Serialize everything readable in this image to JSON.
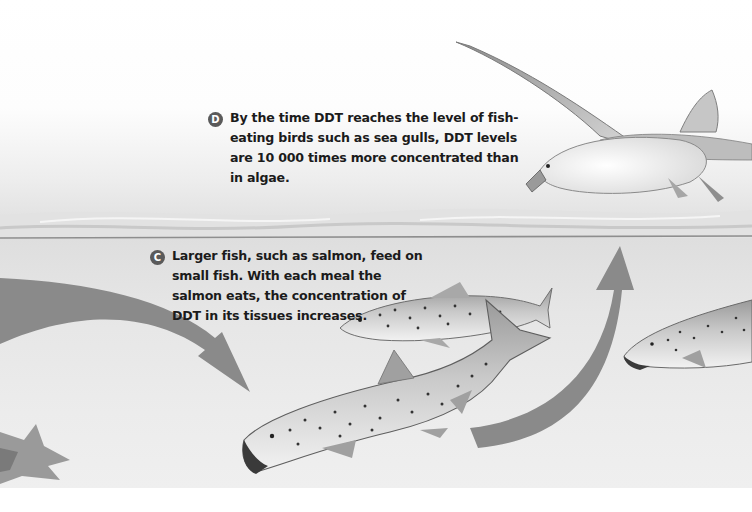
{
  "figure": {
    "callouts": [
      {
        "id": "D",
        "label": "D",
        "lines": [
          "By the time DDT reaches the level of fish-",
          "eating birds such as sea gulls, DDT levels",
          "are 10 000 times more concentrated than",
          "in algae."
        ]
      },
      {
        "id": "C",
        "label": "C",
        "lines": [
          "Larger fish, such as salmon, feed on",
          "small fish. With each meal the",
          "salmon eats, the concentration of",
          "DDT in its tissues increases."
        ]
      }
    ],
    "illustrations": {
      "bird": "sea-gull",
      "fish": [
        "salmon-upper",
        "salmon-lower",
        "salmon-right"
      ],
      "arrows": [
        "arrow-down-into-salmon",
        "arrow-up-to-gull"
      ],
      "plant": "seaweed"
    },
    "colors": {
      "badge": "#5a5a5a",
      "arrow": "#8a8a8a",
      "water": "#e4e4e4",
      "text": "#1b1b1b"
    }
  }
}
